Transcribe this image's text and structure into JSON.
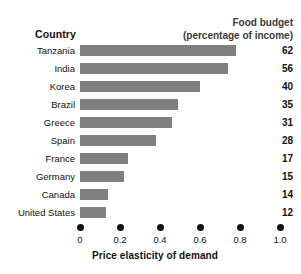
{
  "chart_data": {
    "type": "bar",
    "orientation": "horizontal",
    "title": "",
    "xlabel": "Price elasticity of demand",
    "ylabel": "Country",
    "xlim": [
      0,
      1.0
    ],
    "grid": false,
    "legend": null,
    "categories": [
      "Tanzania",
      "India",
      "Korea",
      "Brazil",
      "Greece",
      "Spain",
      "France",
      "Germany",
      "Canada",
      "United States"
    ],
    "values": [
      0.78,
      0.74,
      0.6,
      0.49,
      0.46,
      0.38,
      0.24,
      0.22,
      0.14,
      0.13
    ],
    "value_labels": [
      "62",
      "56",
      "40",
      "35",
      "31",
      "28",
      "17",
      "15",
      "14",
      "12"
    ],
    "value_label_header": "Food budget",
    "value_label_subheader": "(percentage of income)",
    "category_header": "Country",
    "xticks": [
      0,
      0.2,
      0.4,
      0.6,
      0.8,
      1.0
    ],
    "xtick_labels": [
      "0",
      "0.2",
      "0.4",
      "0.6",
      "0.8",
      "1.0"
    ],
    "bar_color": "#808080",
    "text_color": "#111111",
    "background_color": "#ffffff"
  }
}
